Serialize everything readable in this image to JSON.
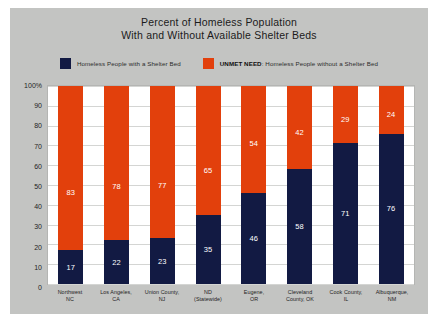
{
  "chart_data": {
    "type": "bar",
    "subtype": "stacked-100-percent",
    "title": "Percent of Homeless Population With and Without Available Shelter Beds",
    "title_lines": [
      "Percent of Homeless Population",
      "With and Without Available Shelter Beds"
    ],
    "xlabel": "",
    "ylabel": "",
    "ylim": [
      0,
      100
    ],
    "y_ticks": [
      "100%",
      "90",
      "80",
      "70",
      "60",
      "50",
      "40",
      "30",
      "20",
      "10",
      "0"
    ],
    "y_tick_values": [
      100,
      90,
      80,
      70,
      60,
      50,
      40,
      30,
      20,
      10,
      0
    ],
    "grid": true,
    "legend_position": "top-center",
    "categories": [
      "Northwest NC",
      "Los Angeles, CA",
      "Union County, NJ",
      "ND (Statewide)",
      "Eugene, OR",
      "Cleveland County, OK",
      "Cook County, IL",
      "Albuquerque, NM"
    ],
    "category_lines": [
      [
        "Northwest",
        "NC"
      ],
      [
        "Los Angeles,",
        "CA"
      ],
      [
        "Union County,",
        "NJ"
      ],
      [
        "ND",
        "(Statewide)"
      ],
      [
        "Eugene,",
        "OR"
      ],
      [
        "Cleveland",
        "County, OK"
      ],
      [
        "Cook County,",
        "IL"
      ],
      [
        "Albuquerque,",
        "NM"
      ]
    ],
    "series": [
      {
        "name": "UNMET NEED: Homeless People without a Shelter Bed",
        "short_name": "Unmet need",
        "color": "#e2400c",
        "values": [
          83,
          78,
          77,
          65,
          54,
          42,
          29,
          24
        ]
      },
      {
        "name": "Homeless People with a Shelter Bed",
        "short_name": "Sheltered",
        "color": "#121a43",
        "values": [
          17,
          22,
          23,
          35,
          46,
          58,
          71,
          76
        ]
      }
    ]
  },
  "legend": {
    "items": [
      {
        "swatch_color": "#121a43",
        "swatch_class": "navy",
        "strong": "",
        "text": "Homeless People with a Shelter Bed"
      },
      {
        "swatch_color": "#e2400c",
        "swatch_class": "orange",
        "strong": "UNMET NEED",
        "text": ": Homeless People without a Shelter Bed"
      }
    ]
  },
  "colors": {
    "slide_background": "#c3c4c2",
    "plot_background": "#ffffff",
    "gridline": "#d4d5d3",
    "plot_border": "#b4b5b3",
    "unmet": "#e2400c",
    "sheltered": "#121a43",
    "text": "#1b1b1b"
  }
}
